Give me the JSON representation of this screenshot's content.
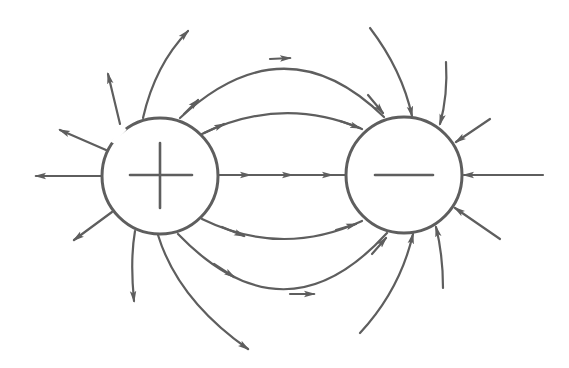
{
  "diagram": {
    "colors": {
      "stroke": "#5e5e5e",
      "background": "#ffffff"
    },
    "charges": [
      {
        "id": "positive",
        "sign": "+",
        "cx": 160,
        "cy": 176,
        "r": 58
      },
      {
        "id": "negative",
        "sign": "−",
        "cx": 404,
        "cy": 175,
        "r": 58
      }
    ]
  }
}
